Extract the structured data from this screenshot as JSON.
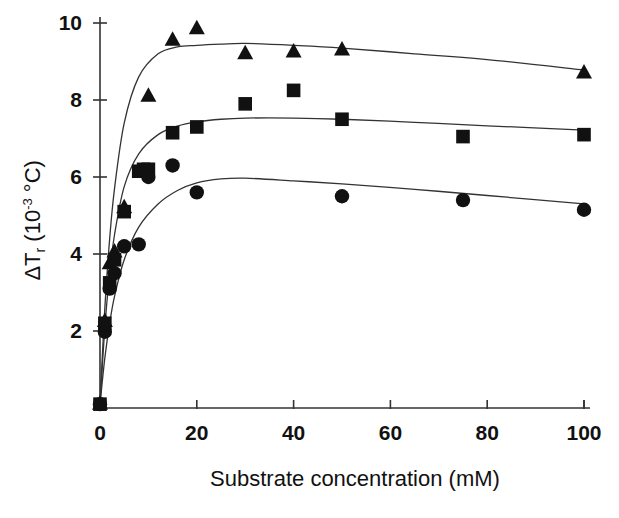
{
  "chart_data": {
    "type": "scatter",
    "title": "",
    "xlabel": "Substrate concentration (mM)",
    "ylabel": "ΔTᵣ (10⁻³ °C)",
    "ylabel_parts": {
      "prefix": "ΔT",
      "subscript": "r",
      "middle": " (10",
      "exponent": "-3",
      "suffix": " °C)"
    },
    "xlim": [
      0,
      104
    ],
    "ylim": [
      0,
      10.4
    ],
    "xticks": [
      0,
      20,
      40,
      60,
      80,
      100
    ],
    "xtick_labels": [
      "0",
      "20",
      "40",
      "60",
      "80",
      "100"
    ],
    "yticks": [
      2,
      4,
      6,
      8,
      10
    ],
    "ytick_labels": [
      "2",
      "4",
      "6",
      "8",
      "10"
    ],
    "grid": false,
    "legend_position": "none",
    "marker_color": "#111111",
    "line_color": "#333333",
    "axis_color": "#333333",
    "background": "#ffffff",
    "series": [
      {
        "name": "triangle-series",
        "marker": "triangle",
        "x": [
          0,
          1,
          2,
          3,
          5,
          10,
          15,
          20,
          30,
          40,
          50,
          100
        ],
        "y": [
          0.1,
          2.25,
          3.75,
          4.05,
          5.2,
          8.1,
          9.55,
          9.85,
          9.2,
          9.25,
          9.3,
          8.7
        ],
        "fit_x": [
          0,
          1,
          2,
          3,
          5,
          8,
          12,
          16,
          20,
          25,
          30,
          40,
          50,
          65,
          80,
          100
        ],
        "fit_y": [
          0.1,
          2.6,
          4.4,
          5.7,
          7.4,
          8.6,
          9.2,
          9.38,
          9.42,
          9.45,
          9.47,
          9.42,
          9.35,
          9.2,
          9.05,
          8.78
        ]
      },
      {
        "name": "square-series",
        "marker": "square",
        "x": [
          0,
          1,
          2,
          3,
          5,
          8,
          9,
          10,
          15,
          20,
          30,
          40,
          50,
          75,
          100
        ],
        "y": [
          0.1,
          2.2,
          3.25,
          3.85,
          5.1,
          6.15,
          6.2,
          6.2,
          7.15,
          7.3,
          7.9,
          8.25,
          7.5,
          7.05,
          7.1
        ],
        "fit_x": [
          0,
          1,
          2,
          3,
          5,
          8,
          12,
          16,
          20,
          25,
          30,
          40,
          50,
          65,
          80,
          100
        ],
        "fit_y": [
          0.1,
          2.1,
          3.5,
          4.5,
          5.75,
          6.6,
          7.1,
          7.32,
          7.43,
          7.5,
          7.53,
          7.53,
          7.5,
          7.42,
          7.33,
          7.22
        ]
      },
      {
        "name": "circle-series",
        "marker": "circle",
        "x": [
          0,
          1,
          2,
          3,
          5,
          8,
          10,
          15,
          20,
          50,
          75,
          100
        ],
        "y": [
          0.1,
          1.98,
          3.1,
          3.5,
          4.2,
          4.25,
          6.0,
          6.3,
          5.6,
          5.5,
          5.4,
          5.15
        ],
        "fit_x": [
          0,
          1,
          2,
          3,
          5,
          8,
          12,
          16,
          20,
          25,
          30,
          40,
          50,
          65,
          80,
          100
        ],
        "fit_y": [
          0.1,
          1.3,
          2.2,
          2.9,
          3.85,
          4.7,
          5.3,
          5.65,
          5.85,
          5.95,
          5.97,
          5.9,
          5.82,
          5.68,
          5.52,
          5.3
        ]
      }
    ]
  },
  "axes": {
    "x_axis_name": "x-axis",
    "y_axis_name": "y-axis"
  }
}
